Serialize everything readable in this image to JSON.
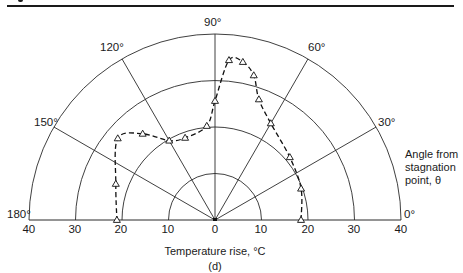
{
  "figure": {
    "panel_label": "(d)",
    "x_axis_title": "Temperature rise, °C",
    "side_label_lines": [
      "Angle from",
      "stagnation",
      "point, θ"
    ]
  },
  "angle_labels": [
    {
      "deg": 0,
      "text": "0°"
    },
    {
      "deg": 30,
      "text": "30°"
    },
    {
      "deg": 60,
      "text": "60°"
    },
    {
      "deg": 90,
      "text": "90°"
    },
    {
      "deg": 120,
      "text": "120°"
    },
    {
      "deg": 150,
      "text": "150°"
    },
    {
      "deg": 180,
      "text": "180°"
    }
  ],
  "radial_tick_labels": [
    "40",
    "30",
    "20",
    "10",
    "0",
    "10",
    "20",
    "30",
    "40"
  ],
  "chart_data": {
    "type": "polar-line",
    "title": "",
    "subtitle": "(d)",
    "xlabel": "Temperature rise, °C",
    "angle_axis_label": "Angle from stagnation point, θ",
    "radial_range": [
      0,
      40
    ],
    "radial_ticks": [
      10,
      20,
      30,
      40
    ],
    "angle_range": [
      0,
      180
    ],
    "angle_ticks": [
      0,
      30,
      60,
      90,
      120,
      150,
      180
    ],
    "grid": true,
    "marker": "open-triangle",
    "line_style": "dashed",
    "series": [
      {
        "name": "Temperature rise",
        "theta": [
          0,
          20,
          40,
          60,
          70,
          75,
          80,
          85,
          90,
          95,
          110,
          120,
          130,
          140,
          160,
          180
        ],
        "r": [
          18.5,
          19.7,
          21.0,
          24.0,
          27.6,
          32.2,
          34.5,
          34.5,
          25.6,
          20.3,
          18.8,
          19.7,
          24.2,
          27.3,
          22.7,
          21.1
        ]
      }
    ]
  }
}
